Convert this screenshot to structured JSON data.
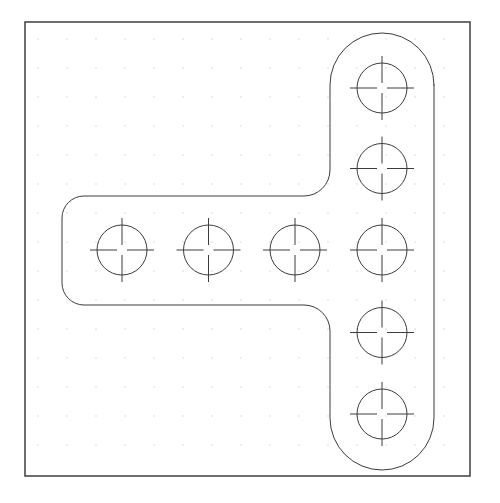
{
  "document": {
    "kind": "cad-technical-drawing",
    "title_fragment": "1000 45",
    "background_color": "#ffffff",
    "line_color": "#3c3c3c",
    "frame_color": "#4a4a4a",
    "grid_dot_color": "#b9b9b9"
  },
  "frame": {
    "label": "drawing-border",
    "x": 25,
    "y": 22,
    "width": 445,
    "height": 454,
    "stroke_width": 1.6
  },
  "grid": {
    "label": "snap-grid",
    "spacing": 29.0,
    "origin_x": 38,
    "origin_y": 39,
    "cols": 15,
    "rows": 15,
    "dot_size": 1.0,
    "color": "#b9b9b9"
  },
  "part": {
    "name": "t-slot-plate-outline",
    "stroke_width": 1.0,
    "vertical_body": {
      "left": 330,
      "right": 434,
      "top": 33,
      "bottom": 470,
      "cap_radius": 52
    },
    "horizontal_arm": {
      "left": 62,
      "right": 330,
      "top": 196,
      "bottom": 305,
      "end_corner_radius": 22,
      "junction_fillet_radius": 26
    }
  },
  "holes": {
    "count": 8,
    "radius": 25,
    "crosshair_reach": 32,
    "crosshair_center_gap": 5,
    "items": [
      {
        "id": "hole-v1",
        "group": "vertical-column",
        "cx": 382,
        "cy": 88
      },
      {
        "id": "hole-v2",
        "group": "vertical-column",
        "cx": 382,
        "cy": 168.5
      },
      {
        "id": "hole-v3",
        "group": "shared-corner",
        "cx": 382,
        "cy": 250
      },
      {
        "id": "hole-v4",
        "group": "vertical-column",
        "cx": 382,
        "cy": 332.5
      },
      {
        "id": "hole-v5",
        "group": "vertical-column",
        "cx": 382,
        "cy": 414
      },
      {
        "id": "hole-h1",
        "group": "horizontal-row",
        "cx": 122,
        "cy": 250
      },
      {
        "id": "hole-h2",
        "group": "horizontal-row",
        "cx": 208.5,
        "cy": 250
      },
      {
        "id": "hole-h3",
        "group": "horizontal-row",
        "cx": 295,
        "cy": 250
      }
    ]
  }
}
